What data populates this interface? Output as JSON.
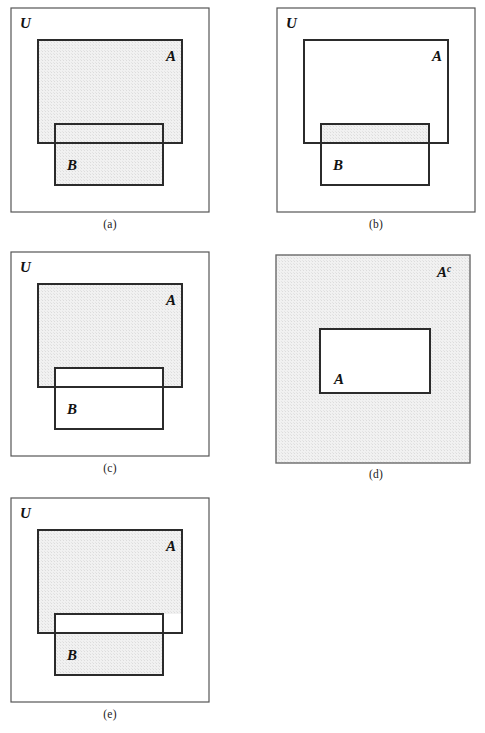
{
  "figure": {
    "background_color": "#ffffff",
    "stroke_color": "#2b2b2b",
    "thin_stroke_color": "#555555",
    "shade_color": "#ececec",
    "shade_dot_color": "#d4d4d4",
    "label_color": "#111111",
    "panels": [
      {
        "id": "a",
        "caption": "(a)",
        "meaning": "A union B",
        "universe_label": "U",
        "set_a_label": "A",
        "set_b_label": "B",
        "shaded_regions": [
          "A-only",
          "A-and-B",
          "B-only"
        ],
        "geometry": {
          "universe": {
            "x": 11,
            "y": 8,
            "w": 198,
            "h": 204
          },
          "set_a": {
            "x": 38,
            "y": 40,
            "w": 144,
            "h": 103
          },
          "set_b": {
            "x": 55,
            "y": 124,
            "w": 108,
            "h": 61
          }
        },
        "labels": {
          "universe_pos": {
            "x": 20,
            "y": 28
          },
          "set_a_pos": {
            "x": 166,
            "y": 61
          },
          "set_b_pos": {
            "x": 67,
            "y": 170
          }
        },
        "caption_pos": {
          "x": 0,
          "y": 218,
          "w": 220
        }
      },
      {
        "id": "b",
        "caption": "(b)",
        "meaning": "A intersect B",
        "universe_label": "U",
        "set_a_label": "A",
        "set_b_label": "B",
        "shaded_regions": [
          "A-and-B"
        ],
        "geometry": {
          "universe": {
            "x": 277,
            "y": 8,
            "w": 198,
            "h": 204
          },
          "set_a": {
            "x": 304,
            "y": 40,
            "w": 144,
            "h": 103
          },
          "set_b": {
            "x": 321,
            "y": 124,
            "w": 108,
            "h": 61
          }
        },
        "labels": {
          "universe_pos": {
            "x": 286,
            "y": 28
          },
          "set_a_pos": {
            "x": 432,
            "y": 61
          },
          "set_b_pos": {
            "x": 333,
            "y": 170
          }
        },
        "caption_pos": {
          "x": 266,
          "y": 218,
          "w": 220
        }
      },
      {
        "id": "c",
        "caption": "(c)",
        "meaning": "A minus B",
        "universe_label": "U",
        "set_a_label": "A",
        "set_b_label": "B",
        "shaded_regions": [
          "A-only"
        ],
        "geometry": {
          "universe": {
            "x": 11,
            "y": 252,
            "w": 198,
            "h": 204
          },
          "set_a": {
            "x": 38,
            "y": 284,
            "w": 144,
            "h": 103
          },
          "set_b": {
            "x": 55,
            "y": 368,
            "w": 108,
            "h": 61
          }
        },
        "labels": {
          "universe_pos": {
            "x": 20,
            "y": 272
          },
          "set_a_pos": {
            "x": 166,
            "y": 305
          },
          "set_b_pos": {
            "x": 67,
            "y": 414
          }
        },
        "caption_pos": {
          "x": 0,
          "y": 462,
          "w": 220
        }
      },
      {
        "id": "d",
        "caption": "(d)",
        "meaning": "complement of A",
        "universe_label": "",
        "complement_label": "A",
        "complement_superscript": "c",
        "set_a_label": "A",
        "shaded_regions": [
          "universe-minus-A"
        ],
        "geometry": {
          "universe": {
            "x": 276,
            "y": 255,
            "w": 194,
            "h": 208
          },
          "set_a": {
            "x": 320,
            "y": 329,
            "w": 110,
            "h": 64
          }
        },
        "labels": {
          "complement_pos": {
            "x": 437,
            "y": 277
          },
          "set_a_pos": {
            "x": 334,
            "y": 384
          }
        },
        "caption_pos": {
          "x": 266,
          "y": 468,
          "w": 220
        }
      },
      {
        "id": "e",
        "caption": "(e)",
        "meaning": "symmetric difference of A and B",
        "universe_label": "U",
        "set_a_label": "A",
        "set_b_label": "B",
        "shaded_regions": [
          "A-only",
          "B-only"
        ],
        "geometry": {
          "universe": {
            "x": 11,
            "y": 498,
            "w": 198,
            "h": 204
          },
          "set_a": {
            "x": 38,
            "y": 530,
            "w": 144,
            "h": 103
          },
          "set_b": {
            "x": 55,
            "y": 614,
            "w": 108,
            "h": 61
          }
        },
        "labels": {
          "universe_pos": {
            "x": 20,
            "y": 518
          },
          "set_a_pos": {
            "x": 166,
            "y": 551
          },
          "set_b_pos": {
            "x": 67,
            "y": 660
          }
        },
        "caption_pos": {
          "x": 0,
          "y": 708,
          "w": 220
        }
      }
    ]
  }
}
